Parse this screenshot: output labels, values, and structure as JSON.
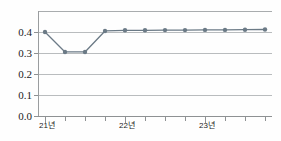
{
  "chart_data": {
    "type": "line",
    "title": "",
    "subtitle": "",
    "xlabel": "",
    "ylabel": "",
    "x": [
      "21년",
      "",
      "",
      "",
      "22년",
      "",
      "",
      "",
      "23년",
      "",
      "",
      ""
    ],
    "categories": [
      "21년",
      "",
      "",
      "",
      "22년",
      "",
      "",
      "",
      "23년",
      "",
      "",
      ""
    ],
    "values": [
      0.4,
      0.305,
      0.305,
      0.405,
      0.408,
      0.408,
      0.409,
      0.409,
      0.41,
      0.41,
      0.411,
      0.412
    ],
    "series": [
      {
        "name": "",
        "values": [
          0.4,
          0.305,
          0.305,
          0.405,
          0.408,
          0.408,
          0.409,
          0.409,
          0.41,
          0.41,
          0.411,
          0.412
        ]
      }
    ],
    "ylim": [
      0.0,
      0.5
    ],
    "xlim": [
      0,
      11
    ],
    "ytick_labels": [
      "0.4",
      "0.3",
      "0.2",
      "0.1",
      "0.0"
    ],
    "ytick_values": [
      0.4,
      0.3,
      0.2,
      0.1,
      0.0
    ],
    "xtick_labels": [
      "21년",
      "22년",
      "23년"
    ],
    "xtick_label_indices": [
      0,
      4,
      8
    ],
    "grid": true,
    "grid_orientation": "horizontal",
    "legend": false,
    "legend_position": "none",
    "marker": "circle",
    "annotations": []
  },
  "style": {
    "line_color": "#6b7a86",
    "marker_color": "#6b7a86",
    "grid_color": "#b9bcbe",
    "axis_color": "#8e9193",
    "text_color": "#1c1c1c",
    "background": "#fefefe"
  },
  "ytick_labels": {
    "t0": "0.4",
    "t1": "0.3",
    "t2": "0.2",
    "t3": "0.1",
    "t4": "0.0"
  },
  "xtick_labels": {
    "t0": "21년",
    "t1": "22년",
    "t2": "23년"
  }
}
